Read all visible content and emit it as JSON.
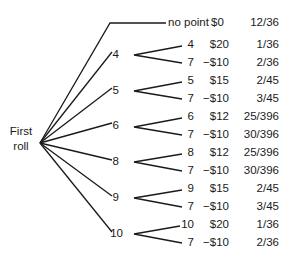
{
  "root": {
    "line1": "First",
    "line2": "roll"
  },
  "no_point": {
    "label": "no point",
    "payoff": "$0",
    "probability": "12/36"
  },
  "branches": [
    {
      "point": "4",
      "win": {
        "outcome": "4",
        "payoff": "$20",
        "probability": "1/36"
      },
      "lose": {
        "outcome": "7",
        "payoff": "−$10",
        "probability": "2/36"
      }
    },
    {
      "point": "5",
      "win": {
        "outcome": "5",
        "payoff": "$15",
        "probability": "2/45"
      },
      "lose": {
        "outcome": "7",
        "payoff": "−$10",
        "probability": "3/45"
      }
    },
    {
      "point": "6",
      "win": {
        "outcome": "6",
        "payoff": "$12",
        "probability": "25/396"
      },
      "lose": {
        "outcome": "7",
        "payoff": "−$10",
        "probability": "30/396"
      }
    },
    {
      "point": "8",
      "win": {
        "outcome": "8",
        "payoff": "$12",
        "probability": "25/396"
      },
      "lose": {
        "outcome": "7",
        "payoff": "−$10",
        "probability": "30/396"
      }
    },
    {
      "point": "9",
      "win": {
        "outcome": "9",
        "payoff": "$15",
        "probability": "2/45"
      },
      "lose": {
        "outcome": "7",
        "payoff": "−$10",
        "probability": "3/45"
      }
    },
    {
      "point": "10",
      "win": {
        "outcome": "10",
        "payoff": "$20",
        "probability": "1/36"
      },
      "lose": {
        "outcome": "7",
        "payoff": "−$10",
        "probability": "2/36"
      }
    }
  ]
}
